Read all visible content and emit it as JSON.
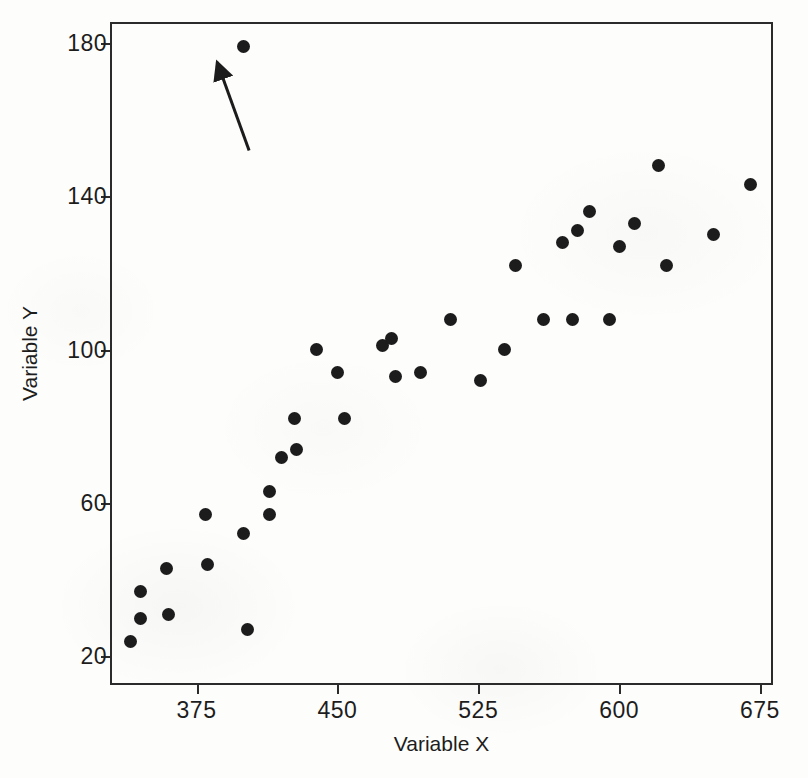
{
  "chart_data": {
    "type": "scatter",
    "title": "",
    "xlabel": "Variable X",
    "ylabel": "Variable Y",
    "xlim": [
      330,
      683
    ],
    "ylim": [
      12,
      185
    ],
    "xticks": [
      375,
      450,
      525,
      600,
      675
    ],
    "xtick_labels": [
      "375",
      "450",
      "525",
      "600",
      "675"
    ],
    "yticks": [
      20,
      60,
      100,
      140,
      180
    ],
    "ytick_labels": [
      "20",
      "60",
      "100",
      "140",
      "180"
    ],
    "grid": false,
    "legend": null,
    "marker": "filled-circle",
    "marker_color": "#1c1c1c",
    "points": [
      {
        "x": 400,
        "y": 179,
        "outlier": true
      },
      {
        "x": 340,
        "y": 24
      },
      {
        "x": 345,
        "y": 37
      },
      {
        "x": 345,
        "y": 30
      },
      {
        "x": 359,
        "y": 43
      },
      {
        "x": 360,
        "y": 31
      },
      {
        "x": 380,
        "y": 57
      },
      {
        "x": 381,
        "y": 44
      },
      {
        "x": 400,
        "y": 52
      },
      {
        "x": 402,
        "y": 27
      },
      {
        "x": 414,
        "y": 57
      },
      {
        "x": 414,
        "y": 63
      },
      {
        "x": 420,
        "y": 72
      },
      {
        "x": 427,
        "y": 82
      },
      {
        "x": 428,
        "y": 74
      },
      {
        "x": 439,
        "y": 100
      },
      {
        "x": 450,
        "y": 94
      },
      {
        "x": 454,
        "y": 82
      },
      {
        "x": 474,
        "y": 101
      },
      {
        "x": 479,
        "y": 103
      },
      {
        "x": 481,
        "y": 93
      },
      {
        "x": 494,
        "y": 94
      },
      {
        "x": 510,
        "y": 108
      },
      {
        "x": 526,
        "y": 92
      },
      {
        "x": 539,
        "y": 100
      },
      {
        "x": 545,
        "y": 122
      },
      {
        "x": 560,
        "y": 108
      },
      {
        "x": 570,
        "y": 128
      },
      {
        "x": 575,
        "y": 108
      },
      {
        "x": 578,
        "y": 131
      },
      {
        "x": 584,
        "y": 136
      },
      {
        "x": 595,
        "y": 108
      },
      {
        "x": 600,
        "y": 127
      },
      {
        "x": 608,
        "y": 133
      },
      {
        "x": 621,
        "y": 148
      },
      {
        "x": 625,
        "y": 122
      },
      {
        "x": 650,
        "y": 130
      },
      {
        "x": 670,
        "y": 143
      }
    ],
    "annotations": [
      {
        "type": "arrow",
        "name": "outlier-arrow",
        "description": "arrow pointing to the outlier point",
        "tail": {
          "x": 403,
          "y": 152
        },
        "tip": {
          "x": 386,
          "y": 175
        }
      }
    ]
  },
  "axes": {
    "x_title": "Variable X",
    "y_title": "Variable Y"
  }
}
